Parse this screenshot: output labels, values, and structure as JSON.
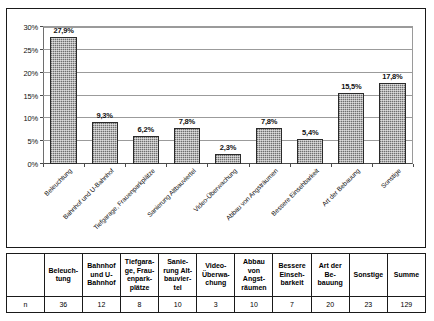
{
  "chart_data": {
    "type": "bar",
    "title": "",
    "xlabel": "",
    "ylabel": "",
    "ylim": [
      0,
      30
    ],
    "ytick_labels": [
      "0%",
      "5%",
      "10%",
      "15%",
      "20%",
      "25%",
      "30%"
    ],
    "ytick_values": [
      0,
      5,
      10,
      15,
      20,
      25,
      30
    ],
    "grid": true,
    "legend": "none",
    "categories": [
      "Beleuchtung",
      "Bahnhof und U-Bahnhof",
      "Tiefgarage, Frauenparkplätze",
      "Sanierung Altbauviertel",
      "Video-Überwachung",
      "Abbau von Angsträumen",
      "Bessere Einsehbarkeit",
      "Art der Bebauung",
      "Sonstige"
    ],
    "values": [
      27.9,
      9.3,
      6.2,
      7.8,
      2.3,
      7.8,
      5.4,
      15.5,
      17.8
    ],
    "value_labels": [
      "27,9%",
      "9,3%",
      "6,2%",
      "7,8%",
      "2,3%",
      "7,8%",
      "5,4%",
      "15,5%",
      "17,8%"
    ]
  },
  "table": {
    "corner_header": "",
    "row_label": "n",
    "headers": [
      "Beleuch-\ntung",
      "Bahnhof\nund U-\nBahnhof",
      "Tiefgara-\nge, Frau-\nenpark-\nplätze",
      "Sanie-\nrung Alt-\nbauvier-\ntel",
      "Video-\nÜberwa-\nchung",
      "Abbau von\nAngst-\nräumen",
      "Bessere\nEinseh-\nbarkeit",
      "Art der Be-\nbauung",
      "Sonstige",
      "Summe"
    ],
    "values": [
      "36",
      "12",
      "8",
      "10",
      "3",
      "10",
      "7",
      "20",
      "23",
      "129"
    ]
  },
  "style": {
    "bar_fill": "#9a9a9a",
    "bar_border": "#2a2a2a",
    "grid_color": "#9b9b9b",
    "frame_color": "#1a1a1a"
  }
}
